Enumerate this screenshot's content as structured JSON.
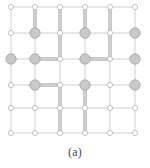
{
  "figure": {
    "caption": "(a)",
    "title": "",
    "background_color": "#ffffff",
    "width": 150,
    "height": 168
  },
  "chart_data": {
    "type": "diagram",
    "subtype": "lattice-graph",
    "title": "",
    "xlabel": "",
    "ylabel": "",
    "grid": true,
    "legend": null,
    "annotations": [
      "(a)"
    ],
    "columns": 6,
    "rows": 6,
    "column_x": [
      11,
      35,
      60,
      85,
      110,
      135
    ],
    "row_y": [
      7,
      33,
      59,
      85,
      108,
      133
    ],
    "colors": {
      "thin_edge": "#c9c9c9",
      "bold_edge": "#b0b0b0",
      "bold_edge_core": "#dcdcdc",
      "large_node_fill": "#c9c9c9",
      "large_node_stroke": "#a8a8a8",
      "small_node_fill": "#ffffff",
      "small_node_stroke": "#b5b5b5",
      "caption": "#4a4a4a",
      "background": "#ffffff"
    },
    "node_radius": {
      "large": 5.2,
      "small": 2.6
    },
    "edge_width": {
      "thin": 0.9,
      "bold": 3.4
    },
    "nodes": [
      {
        "row": 1,
        "col": 1,
        "size": "small"
      },
      {
        "row": 1,
        "col": 2,
        "size": "small"
      },
      {
        "row": 1,
        "col": 3,
        "size": "small"
      },
      {
        "row": 1,
        "col": 4,
        "size": "small"
      },
      {
        "row": 1,
        "col": 5,
        "size": "small"
      },
      {
        "row": 1,
        "col": 6,
        "size": "small"
      },
      {
        "row": 2,
        "col": 1,
        "size": "small"
      },
      {
        "row": 2,
        "col": 2,
        "size": "large"
      },
      {
        "row": 2,
        "col": 3,
        "size": "small"
      },
      {
        "row": 2,
        "col": 4,
        "size": "large"
      },
      {
        "row": 2,
        "col": 5,
        "size": "small"
      },
      {
        "row": 2,
        "col": 6,
        "size": "large"
      },
      {
        "row": 3,
        "col": 1,
        "size": "large"
      },
      {
        "row": 3,
        "col": 2,
        "size": "large"
      },
      {
        "row": 3,
        "col": 3,
        "size": "small"
      },
      {
        "row": 3,
        "col": 4,
        "size": "large"
      },
      {
        "row": 3,
        "col": 5,
        "size": "small"
      },
      {
        "row": 3,
        "col": 6,
        "size": "large"
      },
      {
        "row": 4,
        "col": 1,
        "size": "small"
      },
      {
        "row": 4,
        "col": 2,
        "size": "large"
      },
      {
        "row": 4,
        "col": 3,
        "size": "small"
      },
      {
        "row": 4,
        "col": 4,
        "size": "large"
      },
      {
        "row": 4,
        "col": 5,
        "size": "small"
      },
      {
        "row": 4,
        "col": 6,
        "size": "large"
      },
      {
        "row": 5,
        "col": 1,
        "size": "small"
      },
      {
        "row": 5,
        "col": 2,
        "size": "small"
      },
      {
        "row": 5,
        "col": 3,
        "size": "small"
      },
      {
        "row": 5,
        "col": 4,
        "size": "small"
      },
      {
        "row": 5,
        "col": 5,
        "size": "small"
      },
      {
        "row": 5,
        "col": 6,
        "size": "small"
      },
      {
        "row": 6,
        "col": 1,
        "size": "small"
      },
      {
        "row": 6,
        "col": 2,
        "size": "small"
      },
      {
        "row": 6,
        "col": 3,
        "size": "small"
      },
      {
        "row": 6,
        "col": 4,
        "size": "small"
      },
      {
        "row": 6,
        "col": 5,
        "size": "small"
      },
      {
        "row": 6,
        "col": 6,
        "size": "small"
      }
    ],
    "bold_edges": [
      {
        "orientation": "vertical",
        "col": 2,
        "from_row": 1,
        "to_row": 2
      },
      {
        "orientation": "vertical",
        "col": 3,
        "from_row": 1,
        "to_row": 3
      },
      {
        "orientation": "vertical",
        "col": 4,
        "from_row": 1,
        "to_row": 2
      },
      {
        "orientation": "vertical",
        "col": 5,
        "from_row": 1,
        "to_row": 3
      },
      {
        "orientation": "horizontal",
        "row": 3,
        "from_col": 2,
        "to_col": 3
      },
      {
        "orientation": "horizontal",
        "row": 3,
        "from_col": 4,
        "to_col": 5
      },
      {
        "orientation": "horizontal",
        "row": 4,
        "from_col": 2,
        "to_col": 3
      },
      {
        "orientation": "vertical",
        "col": 3,
        "from_row": 4,
        "to_row": 6
      },
      {
        "orientation": "vertical",
        "col": 4,
        "from_row": 4,
        "to_row": 6
      }
    ]
  }
}
